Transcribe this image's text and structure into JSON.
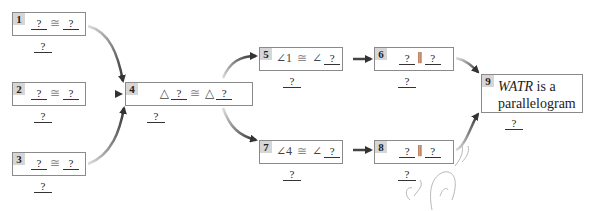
{
  "diagram": {
    "type": "flow-proof",
    "boxes": [
      {
        "id": 1,
        "label": "1",
        "left": "?",
        "symbol": "≅",
        "right": "?",
        "reason": "?"
      },
      {
        "id": 2,
        "label": "2",
        "left": "?",
        "symbol": "≅",
        "right": "?",
        "reason": "?"
      },
      {
        "id": 3,
        "label": "3",
        "left": "?",
        "symbol": "≅",
        "right": "?",
        "reason": "?"
      },
      {
        "id": 4,
        "label": "4",
        "prefix_left": "△",
        "left": "?",
        "symbol": "≅",
        "prefix_right": "△",
        "right": "?",
        "reason": "?"
      },
      {
        "id": 5,
        "label": "5",
        "prefix_left": "∠1",
        "symbol": "≅",
        "prefix_right": "∠",
        "right": "?",
        "reason": "?"
      },
      {
        "id": 6,
        "label": "6",
        "left": "?",
        "symbol": "∥",
        "right": "?",
        "reason": "?"
      },
      {
        "id": 7,
        "label": "7",
        "prefix_left": "∠4",
        "symbol": "≅",
        "prefix_right": "∠",
        "right": "?",
        "reason": "?"
      },
      {
        "id": 8,
        "label": "8",
        "left": "?",
        "symbol": "∥",
        "right": "?",
        "reason": "?"
      },
      {
        "id": 9,
        "label": "9",
        "statement_italic": "WATR",
        "statement_rest_1": " is a",
        "statement_rest_2": "parallelogram",
        "reason": "?"
      }
    ],
    "edges": [
      {
        "from": 1,
        "to": 4
      },
      {
        "from": 2,
        "to": 4
      },
      {
        "from": 3,
        "to": 4
      },
      {
        "from": 4,
        "to": 5
      },
      {
        "from": 4,
        "to": 7
      },
      {
        "from": 5,
        "to": 6
      },
      {
        "from": 7,
        "to": 8
      },
      {
        "from": 6,
        "to": 9
      },
      {
        "from": 8,
        "to": 9
      }
    ],
    "colors": {
      "box_border": "#8a8a8a",
      "number_tab": "#d6d6d6",
      "arrow": "#444444"
    }
  }
}
